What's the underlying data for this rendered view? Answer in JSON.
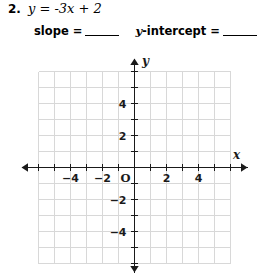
{
  "problem": {
    "number": "2.",
    "equation_plain": "y = -3x + 2",
    "equation_parts": {
      "lhs": "y",
      "equals": "=",
      "slope_term": "−3x",
      "plus": "+",
      "intercept": "2"
    }
  },
  "prompts": {
    "slope_label": "slope",
    "slope_equals": "=",
    "slope_answer": "",
    "intercept_label_italic": "y",
    "intercept_label_rest": "-intercept",
    "intercept_equals": "=",
    "intercept_answer": ""
  },
  "graph": {
    "x_axis_label": "x",
    "y_axis_label": "y",
    "origin_label": "O",
    "x_tick_labels": [
      "−4",
      "−2",
      "2",
      "4"
    ],
    "x_tick_values": [
      -4,
      -2,
      2,
      4
    ],
    "y_tick_labels": [
      "4",
      "2",
      "−2",
      "−4"
    ],
    "y_tick_values": [
      4,
      2,
      -2,
      -4
    ],
    "x_range": [
      -6,
      6
    ],
    "y_range": [
      -6,
      6
    ],
    "grid_step": 1,
    "grid_color": "#d8d8d8",
    "axis_color": "#1a1a1a",
    "label_color": "#1a1a1a",
    "grid_on": true,
    "plotted_line": "none"
  },
  "chart_data": {
    "type": "line",
    "title": "",
    "xlabel": "x",
    "ylabel": "y",
    "xlim": [
      -6,
      6
    ],
    "ylim": [
      -6,
      6
    ],
    "grid": true,
    "xticks": [
      -4,
      -2,
      2,
      4
    ],
    "yticks": [
      4,
      2,
      -2,
      -4
    ],
    "series": [],
    "annotations": [
      "Blank coordinate grid for graphing y = -3x + 2"
    ]
  }
}
